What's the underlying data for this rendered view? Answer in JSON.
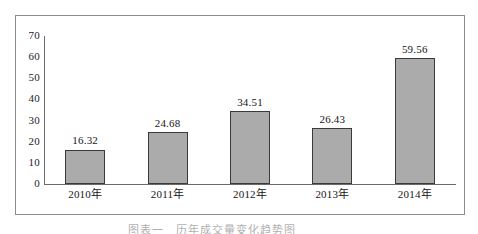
{
  "chart_data": {
    "type": "bar",
    "title": "",
    "subtitle": "",
    "xlabel": "",
    "ylabel": "",
    "categories": [
      "2010年",
      "2011年",
      "2012年",
      "2013年",
      "2014年"
    ],
    "values": [
      16.32,
      24.68,
      34.51,
      26.43,
      59.56
    ],
    "value_labels": [
      "16.32",
      "24.68",
      "34.51",
      "26.43",
      "59.56"
    ],
    "ylim": [
      0,
      70
    ],
    "ytick_labels": [
      "70",
      "60",
      "50",
      "40",
      "30",
      "20",
      "10",
      "0"
    ],
    "ytick_values": [
      70,
      60,
      50,
      40,
      30,
      20,
      10,
      0
    ],
    "grid": false,
    "legend": null,
    "legend_position": "none",
    "bar_fill_color": "#ababab",
    "bar_border_color": "#3a3a3a",
    "axis_color": "#6b6b6b",
    "frame_color": "#8c8c8c",
    "text_color": "#161616"
  },
  "caption": {
    "text": "图表一　历年成交量变化趋势图"
  }
}
